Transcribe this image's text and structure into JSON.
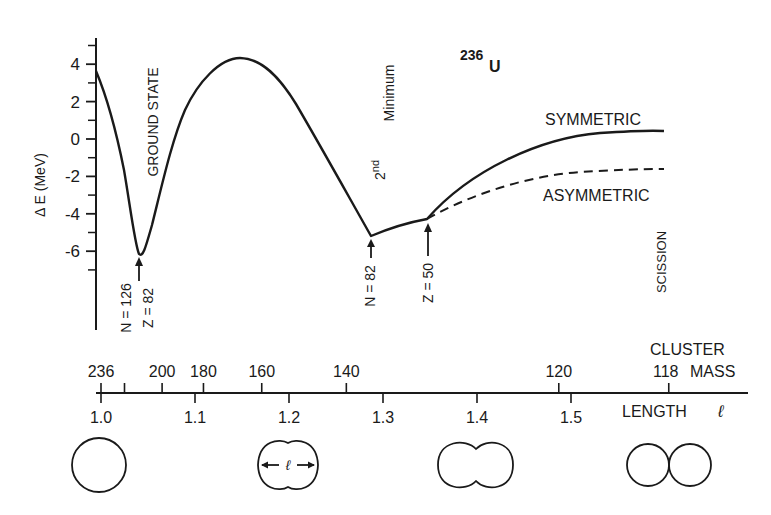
{
  "chart_data": {
    "type": "line",
    "title_parts": {
      "mass_number": "236",
      "element": "U"
    },
    "ylabel": "Δ E (MeV)",
    "xlabel": "LENGTH ℓ",
    "secondary_xlabel": [
      "CLUSTER",
      "MASS"
    ],
    "ylim": [
      -7.2,
      5.2
    ],
    "yticks": [
      {
        "value": 4,
        "label": "4"
      },
      {
        "value": 2,
        "label": "2"
      },
      {
        "value": 0,
        "label": "0"
      },
      {
        "value": -2,
        "label": "-2"
      },
      {
        "value": -4,
        "label": "-4"
      },
      {
        "value": -6,
        "label": "-6"
      }
    ],
    "yminor": [
      5,
      3,
      1,
      -1,
      -3,
      -5,
      -7
    ],
    "xlim": [
      1.0,
      1.62
    ],
    "length_ticks": [
      {
        "value": 1.0,
        "label": "1.0"
      },
      {
        "value": 1.1,
        "label": "1.1"
      },
      {
        "value": 1.2,
        "label": "1.2"
      },
      {
        "value": 1.3,
        "label": "1.3"
      },
      {
        "value": 1.4,
        "label": "1.4"
      },
      {
        "value": 1.5,
        "label": "1.5"
      }
    ],
    "mass_ticks": [
      {
        "length": 1.0,
        "label": "236"
      },
      {
        "length": 1.025,
        "label": ""
      },
      {
        "length": 1.065,
        "label": "200"
      },
      {
        "length": 1.109,
        "label": "180"
      },
      {
        "length": 1.171,
        "label": "160"
      },
      {
        "length": 1.261,
        "label": "140"
      },
      {
        "length": 1.487,
        "label": "120"
      },
      {
        "length": 1.604,
        "label": "118"
      }
    ],
    "series": [
      {
        "name": "SYMMETRIC",
        "style": "solid",
        "x": [
          1.0,
          1.02,
          1.04,
          1.06,
          1.08,
          1.1,
          1.12,
          1.15,
          1.18,
          1.2,
          1.23,
          1.26,
          1.29,
          1.32,
          1.35,
          1.4,
          1.45,
          1.5,
          1.55,
          1.6,
          1.604
        ],
        "values": [
          3.6,
          0.0,
          -6.1,
          -3.0,
          0.0,
          2.1,
          3.5,
          4.3,
          3.5,
          2.3,
          0.0,
          -2.6,
          -5.1,
          -4.6,
          -4.3,
          -2.3,
          -0.9,
          0.0,
          0.4,
          0.5,
          0.5
        ]
      },
      {
        "name": "ASYMMETRIC",
        "style": "dashed",
        "x": [
          1.35,
          1.4,
          1.45,
          1.5,
          1.55,
          1.6,
          1.604
        ],
        "values": [
          -4.3,
          -3.2,
          -2.5,
          -2.0,
          -1.7,
          -1.5,
          -1.5
        ]
      }
    ],
    "annotations": [
      {
        "text": "GROUND STATE",
        "orientation": "vertical"
      },
      {
        "text": "N = 126",
        "arrow_to": "ground-state-minimum"
      },
      {
        "text": "Z = 82",
        "arrow_to": "ground-state-minimum"
      },
      {
        "text": "2nd Minimum",
        "orientation": "vertical"
      },
      {
        "text": "N = 82",
        "arrow_to": "second-minimum"
      },
      {
        "text": "Z = 50",
        "arrow_to": "branch-point"
      },
      {
        "text": "SCISSION",
        "orientation": "vertical"
      },
      {
        "text": "SYMMETRIC",
        "series": "SYMMETRIC"
      },
      {
        "text": "ASYMMETRIC",
        "series": "ASYMMETRIC"
      }
    ],
    "shapes": [
      {
        "length": 1.0,
        "shape": "sphere"
      },
      {
        "length": 1.2,
        "shape": "slightly-necked",
        "dimension_label": "ℓ"
      },
      {
        "length": 1.4,
        "shape": "necked-dumbbell"
      },
      {
        "length": 1.6,
        "shape": "two-touching-spheres"
      }
    ],
    "grid": false,
    "legend": "inline labels"
  },
  "labels": {
    "mass_number": "236",
    "element": "U",
    "ylabel": "Δ E (MeV)",
    "ground_state": "GROUND STATE",
    "n126": "N = 126",
    "z82": "Z = 82",
    "second": "2",
    "second_sup": "nd",
    "minimum": "Minimum",
    "n82": "N = 82",
    "z50": "Z = 50",
    "symmetric": "SYMMETRIC",
    "asymmetric": "ASYMMETRIC",
    "scission": "SCISSION",
    "cluster": "CLUSTER",
    "mass": "MASS",
    "length": "LENGTH",
    "ell": "ℓ"
  },
  "colors": {
    "ink": "#1a1a1a",
    "background": "#ffffff"
  }
}
